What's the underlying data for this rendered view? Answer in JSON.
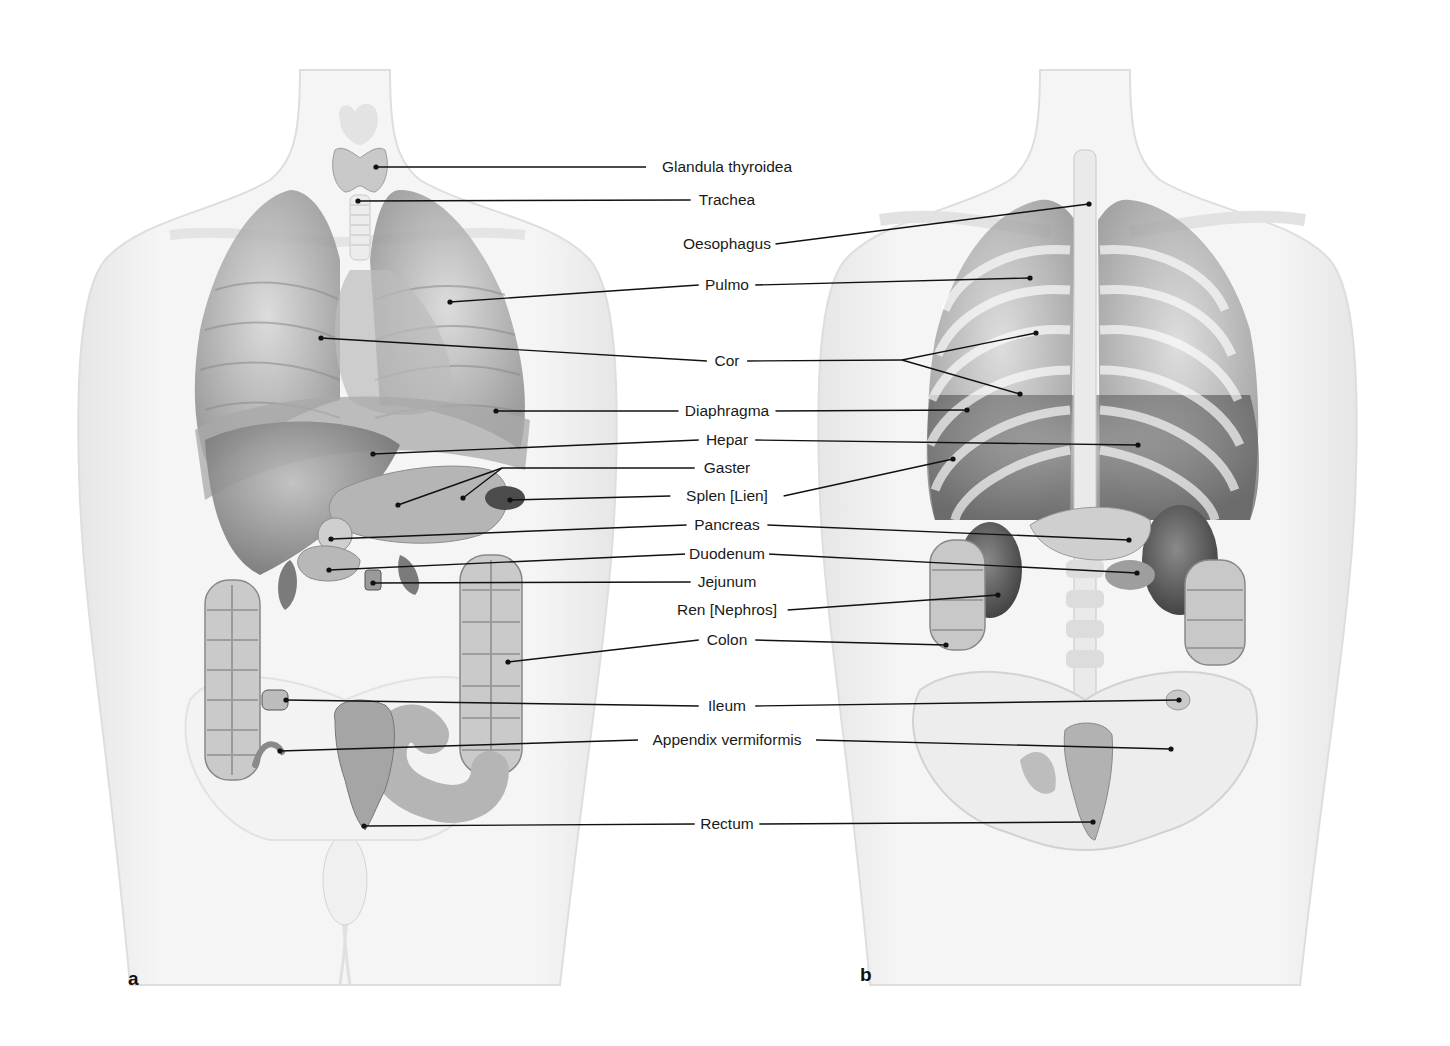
{
  "figure": {
    "panels": [
      {
        "id": "a",
        "letter": "a",
        "view": "anterior",
        "letter_pos": [
          134,
          980
        ]
      },
      {
        "id": "b",
        "letter": "b",
        "view": "posterior",
        "letter_pos": [
          866,
          976
        ]
      }
    ],
    "colors": {
      "background": "#ffffff",
      "silhouette": "#f1f1f1",
      "silhouette_edge": "#d6d6d6",
      "organ_light": "#cfcfcf",
      "organ_mid": "#9d9d9d",
      "organ_dark": "#6a6a6a",
      "leader_line": "#111111",
      "text": "#1a1a1a"
    },
    "labels": [
      {
        "text": "Glandula thyroidea",
        "pos": [
          727,
          167
        ],
        "a_points": [
          [
            376,
            167
          ]
        ],
        "b_points": []
      },
      {
        "text": "Trachea",
        "pos": [
          727,
          200
        ],
        "a_points": [
          [
            358,
            201
          ]
        ],
        "b_points": []
      },
      {
        "text": "Oesophagus",
        "pos": [
          727,
          244
        ],
        "a_points": [],
        "b_points": [
          [
            1089,
            204
          ]
        ]
      },
      {
        "text": "Pulmo",
        "pos": [
          727,
          285
        ],
        "a_points": [
          [
            450,
            302
          ]
        ],
        "b_points": [
          [
            1030,
            278
          ]
        ]
      },
      {
        "text": "Cor",
        "pos": [
          727,
          361
        ],
        "a_points": [
          [
            321,
            338
          ]
        ],
        "b_points": [
          [
            1036,
            333
          ],
          [
            1020,
            394
          ]
        ],
        "b_fork": [
          902,
          360
        ]
      },
      {
        "text": "Diaphragma",
        "pos": [
          727,
          411
        ],
        "a_points": [
          [
            496,
            411
          ]
        ],
        "b_points": [
          [
            967,
            410
          ]
        ]
      },
      {
        "text": "Hepar",
        "pos": [
          727,
          440
        ],
        "a_points": [
          [
            373,
            454
          ]
        ],
        "b_points": [
          [
            1138,
            445
          ]
        ]
      },
      {
        "text": "Gaster",
        "pos": [
          727,
          468
        ],
        "a_points": [
          [
            398,
            505
          ],
          [
            463,
            498
          ]
        ],
        "a_fork": [
          502,
          468
        ],
        "b_points": []
      },
      {
        "text": "Splen [Lien]",
        "pos": [
          727,
          496
        ],
        "a_points": [
          [
            510,
            500
          ]
        ],
        "b_points": [
          [
            953,
            459
          ]
        ]
      },
      {
        "text": "Pancreas",
        "pos": [
          727,
          525
        ],
        "a_points": [
          [
            331,
            539
          ]
        ],
        "b_points": [
          [
            1129,
            540
          ]
        ]
      },
      {
        "text": "Duodenum",
        "pos": [
          727,
          554
        ],
        "a_points": [
          [
            329,
            570
          ]
        ],
        "b_points": [
          [
            1137,
            573
          ]
        ]
      },
      {
        "text": "Jejunum",
        "pos": [
          727,
          582
        ],
        "a_points": [
          [
            373,
            583
          ]
        ],
        "b_points": []
      },
      {
        "text": "Ren [Nephros]",
        "pos": [
          727,
          610
        ],
        "a_points": [],
        "b_points": [
          [
            998,
            595
          ]
        ]
      },
      {
        "text": "Colon",
        "pos": [
          727,
          640
        ],
        "a_points": [
          [
            508,
            662
          ]
        ],
        "b_points": [
          [
            946,
            645
          ]
        ]
      },
      {
        "text": "Ileum",
        "pos": [
          727,
          706
        ],
        "a_points": [
          [
            286,
            700
          ]
        ],
        "b_points": [
          [
            1179,
            700
          ]
        ]
      },
      {
        "text": "Appendix vermiformis",
        "pos": [
          727,
          740
        ],
        "a_points": [
          [
            280,
            751
          ]
        ],
        "b_points": [
          [
            1171,
            749
          ]
        ]
      },
      {
        "text": "Rectum",
        "pos": [
          727,
          824
        ],
        "a_points": [
          [
            364,
            826
          ]
        ],
        "b_points": [
          [
            1093,
            822
          ]
        ]
      }
    ]
  }
}
